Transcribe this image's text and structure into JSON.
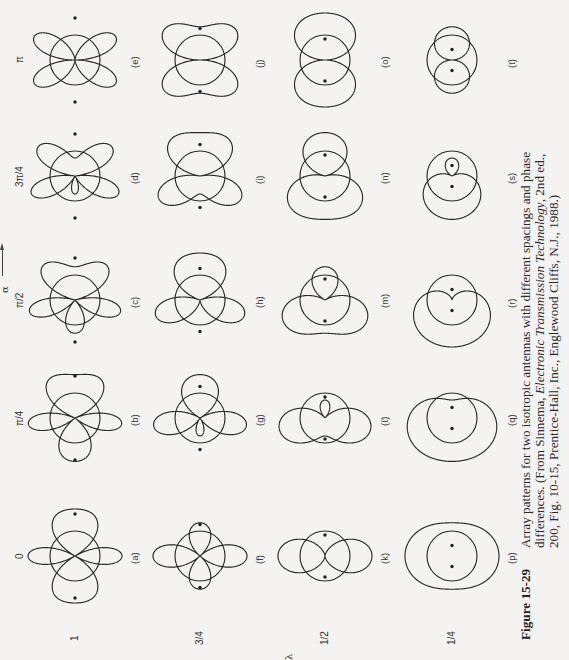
{
  "figure": {
    "number": "Figure 15-29",
    "caption_lines": [
      "Array patterns for two isotropic antennas with different spacings and phase",
      "differences. (From Sinnema, ",
      "200, Fig. 10-15, Prentice-Hall, Inc., Englewood Cliffs, N.J., 1988.)"
    ],
    "caption_italic": "Electronic Transmission Technology",
    "caption_line2_tail": ", 2nd ed.,",
    "phase_axis_label": "α",
    "spacing_axis_label": "d/λ"
  },
  "chart_data": {
    "type": "polar-grid",
    "title": "Array patterns for two isotropic antennas with different spacings and phase differences",
    "rows_axis": "α (phase difference)",
    "columns_axis": "d/λ (spacing)",
    "phase_values": [
      0,
      0.25,
      0.5,
      0.75,
      1.0
    ],
    "phase_labels": [
      "0",
      "π/4",
      "π/2",
      "3π/4",
      "π"
    ],
    "spacing_values": [
      1,
      0.75,
      0.5,
      0.25
    ],
    "spacing_labels": [
      "1",
      "3/4",
      "1/2",
      "1/4"
    ],
    "panels": [
      {
        "label": "(a)",
        "d": 1,
        "alpha_pi": 0
      },
      {
        "label": "(b)",
        "d": 1,
        "alpha_pi": 0.25
      },
      {
        "label": "(c)",
        "d": 1,
        "alpha_pi": 0.5
      },
      {
        "label": "(d)",
        "d": 1,
        "alpha_pi": 0.75
      },
      {
        "label": "(e)",
        "d": 1,
        "alpha_pi": 1.0
      },
      {
        "label": "(f)",
        "d": 0.75,
        "alpha_pi": 0
      },
      {
        "label": "(g)",
        "d": 0.75,
        "alpha_pi": 0.25
      },
      {
        "label": "(h)",
        "d": 0.75,
        "alpha_pi": 0.5
      },
      {
        "label": "(i)",
        "d": 0.75,
        "alpha_pi": 0.75
      },
      {
        "label": "(j)",
        "d": 0.75,
        "alpha_pi": 1.0
      },
      {
        "label": "(k)",
        "d": 0.5,
        "alpha_pi": 0
      },
      {
        "label": "(ℓ)",
        "d": 0.5,
        "alpha_pi": 0.25
      },
      {
        "label": "(m)",
        "d": 0.5,
        "alpha_pi": 0.5
      },
      {
        "label": "(n)",
        "d": 0.5,
        "alpha_pi": 0.75
      },
      {
        "label": "(o)",
        "d": 0.5,
        "alpha_pi": 1.0
      },
      {
        "label": "(p)",
        "d": 0.25,
        "alpha_pi": 0
      },
      {
        "label": "(q)",
        "d": 0.25,
        "alpha_pi": 0.25
      },
      {
        "label": "(r)",
        "d": 0.25,
        "alpha_pi": 0.5
      },
      {
        "label": "(s)",
        "d": 0.25,
        "alpha_pi": 0.75
      },
      {
        "label": "(t)",
        "d": 0.25,
        "alpha_pi": 1.0
      }
    ]
  },
  "colors": {
    "background": "#f4f3f1",
    "ink": "#2a2a2a"
  }
}
